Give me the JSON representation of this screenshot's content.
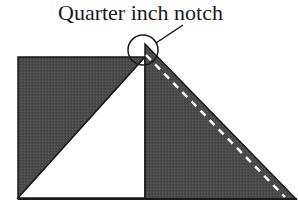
{
  "diagram": {
    "label": "Quarter inch notch",
    "colors": {
      "fill_dark": "#4a4a4a",
      "fill_light": "#ffffff",
      "stroke": "#1a1a1a",
      "dash": "#ffffff"
    },
    "shapes": [
      {
        "name": "left-square-dark-triangle",
        "description": "upper-left half of square, dark fabric"
      },
      {
        "name": "left-square-light-triangle",
        "description": "lower-right half of square, white fabric"
      },
      {
        "name": "right-dark-triangle",
        "description": "right triangle with dashed seam line parallel to hypotenuse"
      },
      {
        "name": "notch-circle",
        "description": "circle highlighting the quarter inch notch at the top point"
      }
    ]
  }
}
